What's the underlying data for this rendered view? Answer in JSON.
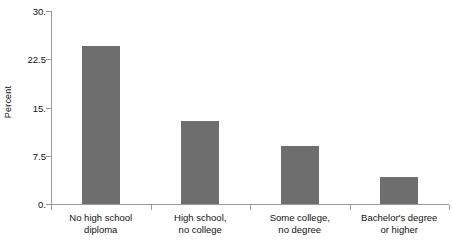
{
  "chart_data": {
    "type": "bar",
    "title": "",
    "subtitle": "",
    "xlabel": "",
    "ylabel": "Percent",
    "ylim": [
      0,
      30
    ],
    "yticks": [
      0,
      7.5,
      15,
      22.5,
      30
    ],
    "ytick_labels": [
      "0.",
      "7.5",
      "15.",
      "22.5",
      "30."
    ],
    "grid": false,
    "legend": null,
    "bar_color": "#6e6e6e",
    "axis_color": "#9a9a9a",
    "background_color": "#ffffff",
    "categories": [
      "No high school\ndiploma",
      "High school,\nno college",
      "Some college,\nno degree",
      "Bachelor's degree\nor higher"
    ],
    "category_lines": [
      [
        "No high school",
        "diploma"
      ],
      [
        "High school,",
        "no college"
      ],
      [
        "Some college,",
        "no degree"
      ],
      [
        "Bachelor's degree",
        "or higher"
      ]
    ],
    "values": [
      24.6,
      12.9,
      9.0,
      4.2
    ]
  }
}
